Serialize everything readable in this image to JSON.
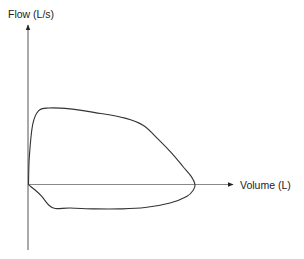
{
  "chart_data": {
    "type": "line",
    "title": "",
    "subtitle": "",
    "xlabel": "Volume (L)",
    "ylabel": "Flow (L/s)",
    "grid": false,
    "legend": null,
    "ticks": {
      "x": [],
      "y": []
    },
    "xlim": [
      0,
      10
    ],
    "ylim": [
      -4.3,
      10
    ],
    "series": [
      {
        "name": "Flow-volume loop",
        "closed": true,
        "color": "#333333",
        "points_x": [
          0,
          0.05,
          0.25,
          0.6,
          1.2,
          2.5,
          4.0,
          5.8,
          6.9,
          7.8,
          8.6,
          9.3,
          9.8,
          10.0,
          9.9,
          9.5,
          8.5,
          7.0,
          5.5,
          4.0,
          2.5,
          1.6,
          1.2,
          0.8,
          0.4,
          0.05,
          0
        ],
        "points_y": [
          0,
          3.0,
          6.5,
          8.0,
          8.3,
          8.2,
          7.8,
          7.2,
          6.4,
          4.9,
          3.4,
          1.9,
          0.8,
          0,
          -0.6,
          -1.3,
          -2.0,
          -2.5,
          -2.65,
          -2.65,
          -2.55,
          -2.6,
          -2.2,
          -1.3,
          -0.6,
          -0.1,
          0
        ]
      }
    ]
  },
  "labels": {
    "y_axis": "Flow (L/s)",
    "x_axis": "Volume (L)"
  },
  "colors": {
    "axis": "#555555",
    "curve": "#333333",
    "text": "#222222"
  }
}
